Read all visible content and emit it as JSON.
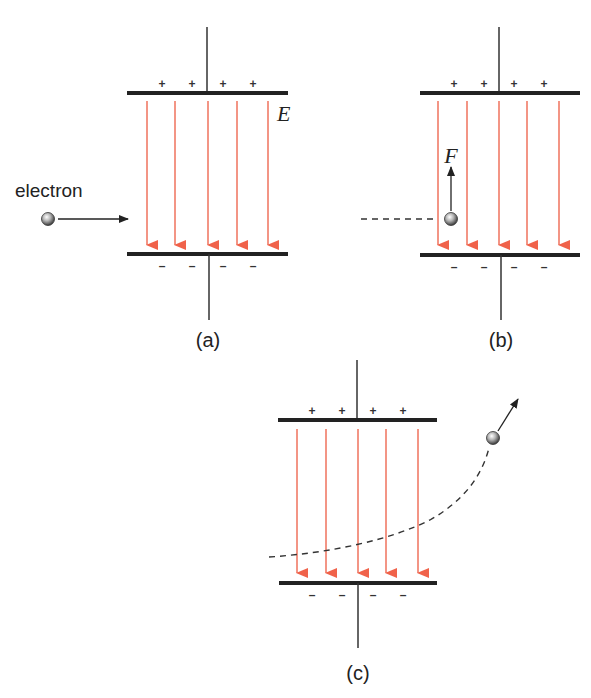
{
  "figure": {
    "top_caption_cropped": "",
    "panels": [
      {
        "id": "a",
        "caption": "(a)",
        "field_label": "E",
        "electron_label": "electron",
        "plate_top_sign": "+",
        "plate_bottom_sign": "–",
        "description": "Electron approaching parallel plates horizontally"
      },
      {
        "id": "b",
        "caption": "(b)",
        "force_label": "F",
        "plate_top_sign": "+",
        "plate_bottom_sign": "–",
        "description": "Electron between plates experiences upward force F"
      },
      {
        "id": "c",
        "caption": "(c)",
        "plate_top_sign": "+",
        "plate_bottom_sign": "–",
        "description": "Electron deflected upward along curved path"
      }
    ],
    "colors": {
      "field_line": "#f28a78",
      "field_arrowhead": "#f0624a",
      "plate": "#222222",
      "wire": "#333333",
      "electron_fill": "#9a9a9a",
      "path": "#333333"
    }
  }
}
